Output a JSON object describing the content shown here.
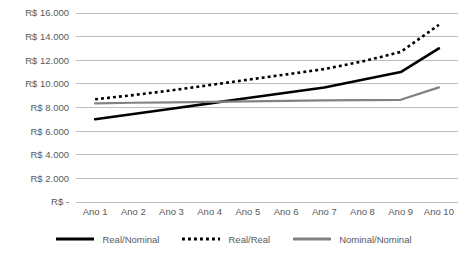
{
  "chart_data": {
    "type": "line",
    "title": "",
    "subtitle": "",
    "xlabel": "",
    "ylabel": "",
    "categories": [
      "Ano 1",
      "Ano 2",
      "Ano 3",
      "Ano 4",
      "Ano 5",
      "Ano 6",
      "Ano 7",
      "Ano 8",
      "Ano 9",
      "Ano 10"
    ],
    "ylim": [
      0,
      16000
    ],
    "ytick_values": [
      0,
      2000,
      4000,
      6000,
      8000,
      10000,
      12000,
      14000,
      16000
    ],
    "ytick_labels": [
      "R$ -",
      "R$ 2.000",
      "R$ 4.000",
      "R$ 6.000",
      "R$ 8.000",
      "R$ 10.000",
      "R$ 12.000",
      "R$ 14.000",
      "R$ 16.000"
    ],
    "grid": true,
    "grid_color": "#bcbec0",
    "legend_position": "bottom",
    "series": [
      {
        "name": "Real/Nominal",
        "style": "solid",
        "color": "#000000",
        "width": 2.6,
        "values": [
          7000,
          7450,
          7900,
          8350,
          8800,
          9250,
          9700,
          10350,
          11000,
          13000
        ]
      },
      {
        "name": "Real/Real",
        "style": "dotted",
        "color": "#000000",
        "width": 2.6,
        "values": [
          8700,
          9050,
          9450,
          9900,
          10350,
          10800,
          11250,
          11900,
          12700,
          15000
        ]
      },
      {
        "name": "Nominal/Nominal",
        "style": "solid",
        "color": "#808285",
        "width": 2.2,
        "values": [
          8350,
          8400,
          8440,
          8480,
          8520,
          8560,
          8600,
          8620,
          8650,
          9700
        ]
      }
    ]
  },
  "legend": {
    "items": [
      {
        "label": "Real/Nominal",
        "style": "solid",
        "color": "#000000"
      },
      {
        "label": "Real/Real",
        "style": "dotted",
        "color": "#000000"
      },
      {
        "label": "Nominal/Nominal",
        "style": "solid",
        "color": "#808285"
      }
    ]
  }
}
